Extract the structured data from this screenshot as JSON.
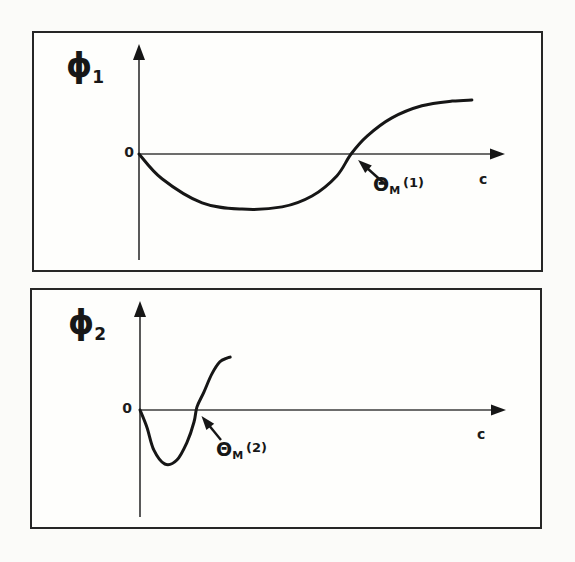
{
  "figure": {
    "ink_color": "#161616",
    "axis_color": "#3d3d3d",
    "background": "#fbfbf9",
    "panel_background": "#fefefc"
  },
  "panels": [
    {
      "y_axis_symbol": "ϕ",
      "y_axis_subscript": "1",
      "origin_label": "0",
      "x_axis_label": "c",
      "annotation": {
        "symbol": "Θ",
        "subscript": "M",
        "superscript": "(1)"
      }
    },
    {
      "y_axis_symbol": "ϕ",
      "y_axis_subscript": "2",
      "origin_label": "0",
      "x_axis_label": "c",
      "annotation": {
        "symbol": "Θ",
        "subscript": "M",
        "superscript": "(2)"
      }
    }
  ],
  "chart_data": [
    {
      "type": "line",
      "title": "phi1 versus concentration c (schematic)",
      "xlabel": "c",
      "ylabel": "phi1",
      "x_range": [
        0,
        10
      ],
      "y_range": [
        -3.2,
        3.3
      ],
      "grid": false,
      "x": [
        0,
        0.63,
        1.73,
        2.82,
        3.92,
        4.74,
        5.42,
        5.81,
        6.25,
        6.93,
        7.75,
        8.58,
        9.12
      ],
      "y": [
        0,
        -0.68,
        -1.34,
        -1.51,
        -1.45,
        -1.15,
        -0.6,
        0,
        0.49,
        0.99,
        1.32,
        1.45,
        1.48
      ],
      "zero_crossing_annotation": {
        "label": "Θ_M (1)",
        "x": 5.81,
        "y": 0
      }
    },
    {
      "type": "line",
      "title": "phi2 versus concentration c (schematic)",
      "xlabel": "c",
      "ylabel": "phi2",
      "x_range": [
        0,
        10
      ],
      "y_range": [
        -3.2,
        3.2
      ],
      "grid": false,
      "x": [
        0,
        0.19,
        0.38,
        0.68,
        1.01,
        1.29,
        1.48,
        1.56,
        1.75,
        1.97,
        2.19,
        2.38,
        2.47
      ],
      "y": [
        0,
        -0.47,
        -1.1,
        -1.48,
        -1.37,
        -0.88,
        -0.33,
        0.08,
        0.49,
        0.99,
        1.32,
        1.42,
        1.45
      ],
      "zero_crossing_annotation": {
        "label": "Θ_M (2)",
        "x": 1.52,
        "y": 0
      }
    }
  ]
}
